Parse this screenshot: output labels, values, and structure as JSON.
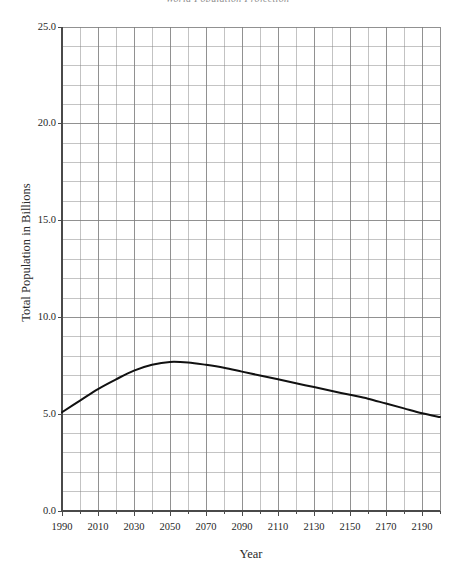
{
  "chart_data": {
    "type": "line",
    "title": "World Population Projection",
    "xlabel": "Year",
    "ylabel": "Total Population in Billions",
    "xlim": [
      1990,
      2200
    ],
    "ylim": [
      0.0,
      25.0
    ],
    "grid": true,
    "legend": false,
    "x_tick_labels": [
      "1990",
      "2010",
      "2030",
      "2050",
      "2070",
      "2090",
      "2110",
      "2130",
      "2150",
      "2170",
      "2190"
    ],
    "x_tick_values": [
      1990,
      2010,
      2030,
      2050,
      2070,
      2090,
      2110,
      2130,
      2150,
      2170,
      2190
    ],
    "x_minor_step": 10,
    "y_tick_labels": [
      "0.0",
      "5.0",
      "10.0",
      "15.0",
      "20.0",
      "25.0"
    ],
    "y_tick_values": [
      0.0,
      5.0,
      10.0,
      15.0,
      20.0,
      25.0
    ],
    "y_minor_step": 1.0,
    "series": [
      {
        "name": "Total Population",
        "color": "#111111",
        "x": [
          1990,
          2000,
          2010,
          2020,
          2030,
          2040,
          2050,
          2060,
          2070,
          2080,
          2090,
          2100,
          2110,
          2120,
          2130,
          2140,
          2150,
          2160,
          2170,
          2180,
          2190,
          2200
        ],
        "values": [
          5.1,
          5.7,
          6.3,
          6.8,
          7.25,
          7.55,
          7.7,
          7.67,
          7.55,
          7.4,
          7.2,
          7.0,
          6.8,
          6.6,
          6.4,
          6.2,
          6.0,
          5.8,
          5.55,
          5.3,
          5.05,
          4.85
        ]
      }
    ],
    "annotations": []
  },
  "axes": {
    "y_title": "Total Population in Billions",
    "x_title": "Year"
  },
  "style": {
    "grid_color": "#808080",
    "axis_color": "#4a4a4a",
    "line_color": "#111111",
    "background": "#ffffff"
  }
}
